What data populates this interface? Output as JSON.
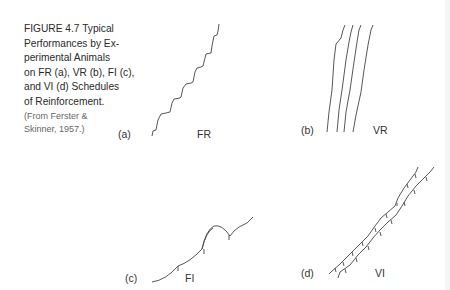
{
  "caption": {
    "lines": [
      "FIGURE 4.7  Typical",
      "Performances by Ex-",
      "perimental Animals",
      "on FR (a), VR (b), FI (c),",
      "and VI (d) Schedules",
      "of Reinforcement."
    ],
    "source_lines": [
      "(From Ferster &",
      "Skinner, 1957.)"
    ]
  },
  "panels": [
    {
      "letter": "(a)",
      "name": "FR",
      "description": "Staircase cumulative record: steady responding with brief post-reinforcement pauses"
    },
    {
      "letter": "(b)",
      "name": "VR",
      "description": "Four steep, nearly vertical cumulative records"
    },
    {
      "letter": "(c)",
      "name": "FI",
      "description": "Scalloped cumulative record with reinforcement ticks"
    },
    {
      "letter": "(d)",
      "name": "VI",
      "description": "Two steady moderate-slope records with frequent reinforcement ticks"
    }
  ]
}
